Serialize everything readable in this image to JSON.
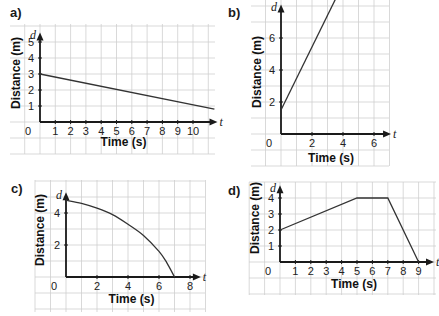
{
  "panels": [
    {
      "id": "a",
      "label": "a)"
    },
    {
      "id": "b",
      "label": "b)"
    },
    {
      "id": "c",
      "label": "c)"
    },
    {
      "id": "d",
      "label": "d)"
    }
  ],
  "chart_data": [
    {
      "panel": "a)",
      "type": "line",
      "title": "",
      "xlabel": "Time (s)",
      "ylabel": "Distance (m)",
      "x_var": "t",
      "y_var": "d",
      "x_ticks": [
        1,
        2,
        3,
        4,
        5,
        6,
        7,
        8,
        9,
        10
      ],
      "y_ticks": [
        1,
        2,
        3,
        4,
        5
      ],
      "origin_label": "0",
      "xlim": [
        0,
        11.5
      ],
      "ylim": [
        0,
        5.5
      ],
      "grid": true,
      "series": [
        {
          "name": "distance",
          "x": [
            0,
            11.4
          ],
          "y": [
            3,
            0.8
          ]
        }
      ]
    },
    {
      "panel": "b)",
      "type": "line",
      "title": "",
      "xlabel": "Time (s)",
      "ylabel": "Distance (m)",
      "x_var": "t",
      "y_var": "d",
      "x_ticks": [
        2,
        4,
        6
      ],
      "y_ticks": [
        2,
        4,
        6
      ],
      "origin_label": "0",
      "xlim": [
        0,
        7
      ],
      "ylim": [
        0,
        7.5
      ],
      "grid": true,
      "series": [
        {
          "name": "distance",
          "x": [
            0,
            3.5
          ],
          "y": [
            1.5,
            8.4
          ]
        }
      ]
    },
    {
      "panel": "c)",
      "type": "line",
      "title": "",
      "xlabel": "Time (s)",
      "ylabel": "Distance (m)",
      "x_var": "t",
      "y_var": "d",
      "x_ticks": [
        2,
        4,
        6,
        8
      ],
      "y_ticks": [
        2,
        4
      ],
      "origin_label": "0",
      "xlim": [
        0,
        8.7
      ],
      "ylim": [
        0,
        5
      ],
      "grid": true,
      "series": [
        {
          "name": "distance",
          "x": [
            0,
            1,
            2,
            3,
            4,
            5,
            6,
            6.5,
            7
          ],
          "y": [
            4.8,
            4.6,
            4.3,
            3.9,
            3.3,
            2.6,
            1.6,
            0.9,
            0
          ]
        }
      ]
    },
    {
      "panel": "d)",
      "type": "line",
      "title": "",
      "xlabel": "Time (s)",
      "ylabel": "Distance (m)",
      "x_var": "t",
      "y_var": "d",
      "x_ticks": [
        1,
        2,
        3,
        4,
        5,
        6,
        7,
        8,
        9
      ],
      "y_ticks": [
        1,
        2,
        3,
        4
      ],
      "origin_label": "0",
      "xlim": [
        0,
        10
      ],
      "ylim": [
        0,
        4.5
      ],
      "grid": true,
      "series": [
        {
          "name": "distance",
          "x": [
            0,
            5,
            7,
            9
          ],
          "y": [
            2,
            4,
            4,
            0
          ]
        }
      ]
    }
  ],
  "layout": [
    {
      "grid": [
        10,
        24,
        215,
        154
      ],
      "origin": [
        40,
        122
      ],
      "ux": 15.3,
      "uy": 16,
      "x_end": 11.6,
      "y_end": 5.6,
      "label_pos": [
        10,
        5
      ],
      "xtitle_y": 146,
      "ytitle_x": 20,
      "ytitle_y": 73
    },
    {
      "grid": [
        251,
        0,
        389,
        166
      ],
      "origin": [
        281,
        134
      ],
      "ux": 15.5,
      "uy": 16,
      "x_end": 7.1,
      "y_end": 8.1,
      "label_pos": [
        228,
        5
      ],
      "xtitle_y": 162,
      "ytitle_x": 261,
      "ytitle_y": 72
    },
    {
      "grid": [
        35,
        180,
        205,
        312
      ],
      "origin": [
        66,
        277
      ],
      "ux": 15.5,
      "uy": 16,
      "x_end": 8.7,
      "y_end": 5.3,
      "label_pos": [
        11,
        181
      ],
      "xtitle_y": 303,
      "ytitle_x": 44,
      "ytitle_y": 230
    },
    {
      "grid": [
        249,
        182,
        436,
        295
      ],
      "origin": [
        280,
        262
      ],
      "ux": 15.4,
      "uy": 16,
      "x_end": 10,
      "y_end": 4.8,
      "label_pos": [
        228,
        183
      ],
      "xtitle_y": 288,
      "ytitle_x": 259,
      "ytitle_y": 218
    }
  ]
}
